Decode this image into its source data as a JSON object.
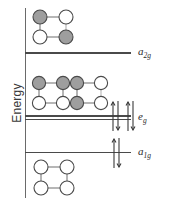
{
  "figure": {
    "type": "energy-level-diagram",
    "axis": {
      "ylabel": "Energy",
      "ticks_shown": false,
      "grid": false
    },
    "levels": [
      {
        "id": "a2g",
        "label_base": "a",
        "label_sub": "2g",
        "label_full": "a2g",
        "relative_energy": "highest",
        "degeneracy": 1,
        "line_style": "single",
        "electrons": 0,
        "arrow_pairs": 0
      },
      {
        "id": "eg",
        "label_base": "e",
        "label_sub": "g",
        "label_full": "eg",
        "relative_energy": "middle",
        "degeneracy": 2,
        "line_style": "double",
        "electrons": 4,
        "arrow_pairs": 2
      },
      {
        "id": "a1g",
        "label_base": "a",
        "label_sub": "1g",
        "label_full": "a1g",
        "relative_energy": "lowest",
        "degeneracy": 1,
        "line_style": "single",
        "electrons": 2,
        "arrow_pairs": 1
      }
    ],
    "orbital_diagrams": [
      {
        "name": "a2g-orbital",
        "associated_level": "a2g",
        "nodes": [
          {
            "position": "top-left",
            "fill": "shaded"
          },
          {
            "position": "top-right",
            "fill": "open"
          },
          {
            "position": "bottom-left",
            "fill": "open"
          },
          {
            "position": "bottom-right",
            "fill": "shaded"
          }
        ],
        "bonds": [
          "top",
          "left",
          "bottom",
          "right"
        ]
      },
      {
        "name": "eg-orbital-1",
        "associated_level": "eg",
        "nodes": [
          {
            "position": "top-left",
            "fill": "shaded"
          },
          {
            "position": "top-right",
            "fill": "shaded"
          },
          {
            "position": "bottom-left",
            "fill": "open"
          },
          {
            "position": "bottom-right",
            "fill": "open"
          }
        ],
        "bonds": [
          "top",
          "left",
          "bottom",
          "right"
        ]
      },
      {
        "name": "eg-orbital-2",
        "associated_level": "eg",
        "nodes": [
          {
            "position": "top-left",
            "fill": "shaded"
          },
          {
            "position": "top-right",
            "fill": "open"
          },
          {
            "position": "bottom-left",
            "fill": "shaded"
          },
          {
            "position": "bottom-right",
            "fill": "open"
          }
        ],
        "bonds": [
          "top",
          "left",
          "bottom",
          "right"
        ]
      },
      {
        "name": "a1g-orbital",
        "associated_level": "a1g",
        "nodes": [
          {
            "position": "top-left",
            "fill": "open"
          },
          {
            "position": "top-right",
            "fill": "open"
          },
          {
            "position": "bottom-left",
            "fill": "open"
          },
          {
            "position": "bottom-right",
            "fill": "open"
          }
        ],
        "bonds": [
          "top",
          "left",
          "bottom",
          "right"
        ]
      }
    ]
  },
  "colors": {
    "shaded_node": "#9e9e9e",
    "open_node": "#ffffff",
    "node_stroke": "#4a4a4a",
    "bond": "#6a6a6a",
    "level_line": "#4a4a4a",
    "axis": "#6a6a6a",
    "text": "#2b2b2b",
    "background": "#ffffff"
  }
}
